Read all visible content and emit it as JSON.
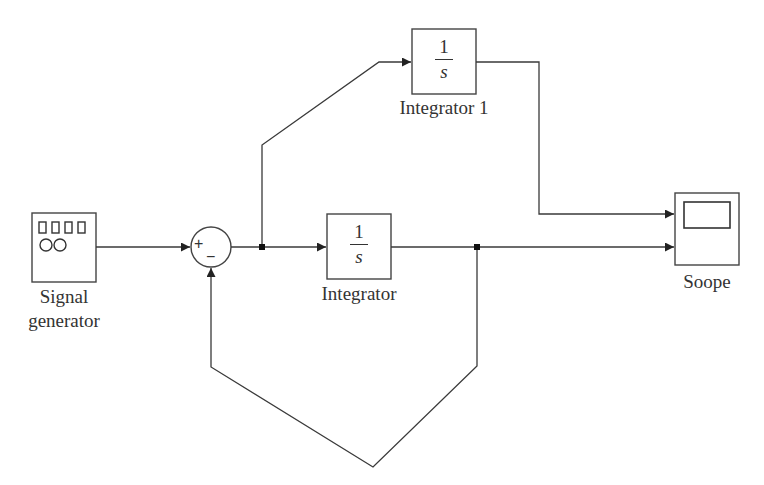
{
  "diagram": {
    "type": "simulink-block-diagram",
    "blocks": {
      "signal_generator": {
        "label_line1": "Signal",
        "label_line2": "generator",
        "icon": "signal-generator-icon"
      },
      "sum": {
        "plus_sign": "+",
        "minus_sign": "−",
        "icon": "sum-icon"
      },
      "integrator": {
        "numerator": "1",
        "denominator": "s",
        "label": "Integrator"
      },
      "integrator1": {
        "numerator": "1",
        "denominator": "s",
        "label": "Integrator 1"
      },
      "scope": {
        "label": "Soope",
        "icon": "scope-icon"
      }
    },
    "connections": [
      {
        "from": "Signal generator",
        "to": "Sum (+)"
      },
      {
        "from": "Sum",
        "to": "Integrator"
      },
      {
        "from": "Sum output branch",
        "to": "Integrator 1"
      },
      {
        "from": "Integrator 1",
        "to": "Scope input 1"
      },
      {
        "from": "Integrator",
        "to": "Scope input 2"
      },
      {
        "from": "Integrator output branch",
        "to": "Sum (−)"
      }
    ],
    "colors": {
      "line": "#3a3a3a",
      "background": "#ffffff"
    }
  }
}
